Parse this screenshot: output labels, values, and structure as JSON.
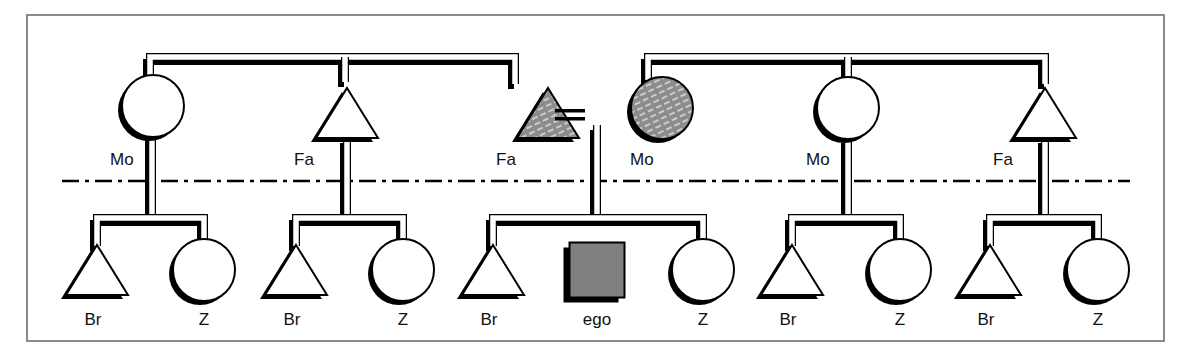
{
  "diagram": {
    "type": "kinship-chart",
    "frame": {
      "x": 27,
      "y": 15,
      "w": 1137,
      "h": 326,
      "stroke": "#8a8a8a"
    },
    "generation_divider": {
      "y": 181,
      "x1": 62,
      "x2": 1130,
      "style": "dash-dot"
    },
    "colors": {
      "line": "#000000",
      "fill_plain": "#ffffff",
      "fill_shaded": "#8c8c8c",
      "fill_ego": "#808080",
      "hatch": "#e6e6e6"
    },
    "marriage_sign": {
      "x": 555,
      "y": 113,
      "w": 30,
      "label": "="
    },
    "parent_groups": [
      {
        "id": "left",
        "bar_x1": 150,
        "bar_x2": 518,
        "bar_y": 60,
        "drops": [
          150,
          345,
          515
        ]
      },
      {
        "id": "right",
        "bar_x1": 648,
        "bar_x2": 1048,
        "bar_y": 60,
        "drops": [
          648,
          848,
          1045
        ]
      }
    ],
    "parents": [
      {
        "id": "p1",
        "shape": "circle",
        "cx": 153,
        "cy": 106,
        "label": "Mo",
        "label_x": 110,
        "label_y": 165,
        "shaded": false
      },
      {
        "id": "p2",
        "shape": "triangle",
        "cx": 347,
        "cy": 113,
        "label": "Fa",
        "label_x": 294,
        "label_y": 165,
        "shaded": false
      },
      {
        "id": "p3",
        "shape": "triangle",
        "cx": 548,
        "cy": 113,
        "label": "Fa",
        "label_x": 496,
        "label_y": 165,
        "shaded": true
      },
      {
        "id": "p4",
        "shape": "circle",
        "cx": 662,
        "cy": 108,
        "label": "Mo",
        "label_x": 630,
        "label_y": 165,
        "shaded": true
      },
      {
        "id": "p5",
        "shape": "circle",
        "cx": 848,
        "cy": 108,
        "label": "Mo",
        "label_x": 806,
        "label_y": 165,
        "shaded": false
      },
      {
        "id": "p6",
        "shape": "triangle",
        "cx": 1045,
        "cy": 113,
        "label": "Fa",
        "label_x": 993,
        "label_y": 165,
        "shaded": false
      }
    ],
    "sibling_groups": [
      {
        "parent_x": 152,
        "bar_x1": 97,
        "bar_x2": 204,
        "stem_top": 135
      },
      {
        "parent_x": 347,
        "bar_x1": 296,
        "bar_x2": 403,
        "stem_top": 138
      },
      {
        "parent_x": 597,
        "bar_x1": 493,
        "bar_x2": 703,
        "stem_top": 125
      },
      {
        "parent_x": 848,
        "bar_x1": 792,
        "bar_x2": 900,
        "stem_top": 138
      },
      {
        "parent_x": 1045,
        "bar_x1": 990,
        "bar_x2": 1098,
        "stem_top": 138
      }
    ],
    "children": [
      {
        "shape": "triangle",
        "cx": 97,
        "label": "Br"
      },
      {
        "shape": "circle",
        "cx": 204,
        "label": "Z"
      },
      {
        "shape": "triangle",
        "cx": 296,
        "label": "Br"
      },
      {
        "shape": "circle",
        "cx": 403,
        "label": "Z"
      },
      {
        "shape": "triangle",
        "cx": 493,
        "label": "Br"
      },
      {
        "shape": "square",
        "cx": 597,
        "label": "ego",
        "ego": true
      },
      {
        "shape": "circle",
        "cx": 703,
        "label": "Z"
      },
      {
        "shape": "triangle",
        "cx": 792,
        "label": "Br"
      },
      {
        "shape": "circle",
        "cx": 900,
        "label": "Z"
      },
      {
        "shape": "triangle",
        "cx": 990,
        "label": "Br"
      },
      {
        "shape": "circle",
        "cx": 1098,
        "label": "Z"
      }
    ],
    "child_row": {
      "bar_y": 218,
      "node_cy": 270,
      "label_y": 325
    }
  }
}
